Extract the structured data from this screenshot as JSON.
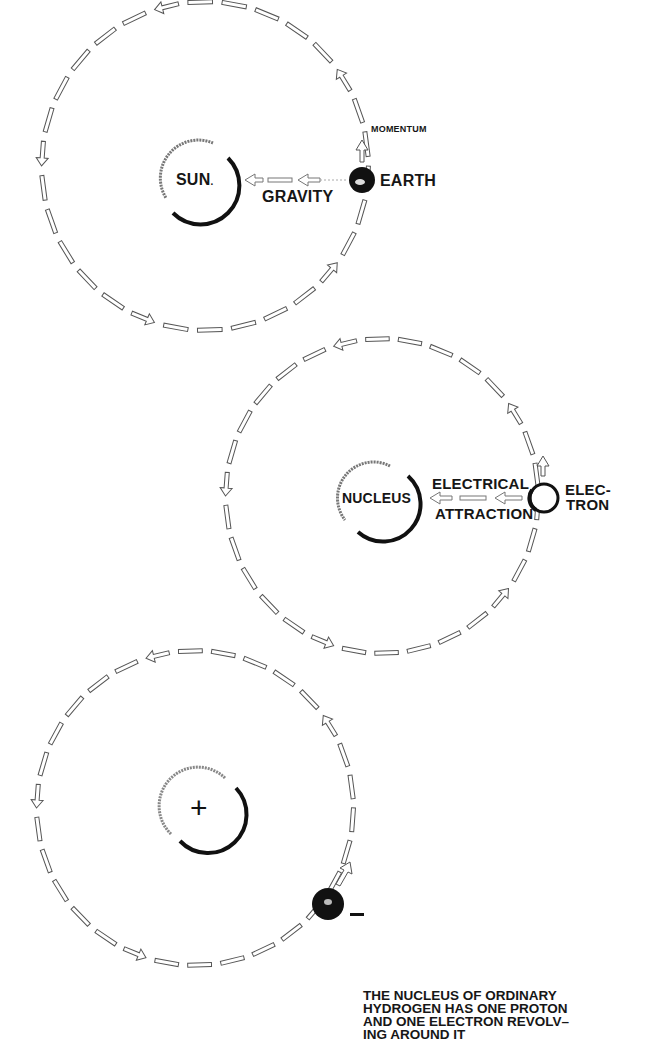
{
  "diagrams": [
    {
      "id": "solar",
      "orbit": {
        "cx": 205,
        "cy": 166,
        "rx": 163,
        "ry": 164,
        "direction": "counterclockwise"
      },
      "center_body": {
        "label": "SUN",
        "label_suffix": ".",
        "cx": 200,
        "cy": 180,
        "r": 38
      },
      "orbiting_body": {
        "label": "EARTH",
        "cx": 362,
        "cy": 180,
        "r": 13,
        "fill": "#111111"
      },
      "force_label": "GRAVITY",
      "momentum_label": "MOMENTUM"
    },
    {
      "id": "atom-labeled",
      "orbit": {
        "cx": 382,
        "cy": 496,
        "rx": 156,
        "ry": 157,
        "direction": "counterclockwise"
      },
      "center_body": {
        "label": "NUCLEUS",
        "cx": 375,
        "cy": 498,
        "r": 38
      },
      "orbiting_body": {
        "label_line1": "ELEC-",
        "label_line2": "TRON",
        "cx": 544,
        "cy": 498,
        "r": 14,
        "fill": "#ffffff"
      },
      "force_label_line1": "ELECTRICAL",
      "force_label_line2": "ATTRACTION"
    },
    {
      "id": "hydrogen",
      "orbit": {
        "cx": 195,
        "cy": 808,
        "rx": 158,
        "ry": 157,
        "direction": "counterclockwise"
      },
      "center_body": {
        "symbol": "+",
        "cx": 200,
        "cy": 810,
        "r": 38
      },
      "orbiting_body": {
        "symbol": "−",
        "cx": 328,
        "cy": 904,
        "r": 16,
        "fill": "#111111"
      }
    }
  ],
  "caption": {
    "lines": [
      "THE NUCLEUS OF ORDINARY",
      "HYDROGEN HAS ONE PROTON",
      "AND ONE ELECTRON REVOLV–",
      "ING AROUND IT"
    ]
  },
  "colors": {
    "ink": "#111111",
    "paper": "#ffffff",
    "dash_fill": "#ffffff",
    "dash_stroke": "#555555"
  }
}
